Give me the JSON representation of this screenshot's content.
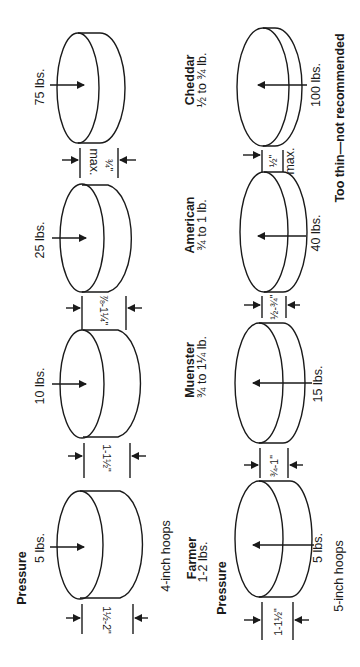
{
  "figure": {
    "orientation": "rotated 90 degrees counter-clockwise",
    "line_color": "#1a1a1a",
    "background": "#ffffff"
  },
  "top_row": {
    "hoop_label": "4-inch hoops",
    "pressure_label": "Pressure",
    "cylinders": [
      {
        "weight": "5 lbs.",
        "thickness": "1½-2\""
      },
      {
        "weight": "10 lbs.",
        "thickness": "1-1½\""
      },
      {
        "weight": "25 lbs.",
        "thickness": "⅞-1¼\""
      },
      {
        "weight": "75 lbs.",
        "thickness": "¾\" max."
      }
    ],
    "group_label": {
      "name": "Farmer",
      "size": "1-2 lbs."
    }
  },
  "bottom_row": {
    "hoop_label": "5-inch hoops",
    "pressure_label": "Pressure",
    "cylinders": [
      {
        "weight": "5 lbs.",
        "thickness": "1-1½\"",
        "cheese": "Farmer",
        "cheese_size": "1-2 lbs."
      },
      {
        "weight": "15 lbs.",
        "thickness": "¾-1\"",
        "cheese": "Muenster",
        "cheese_size": "¾ to 1¼ lb."
      },
      {
        "weight": "40 lbs.",
        "thickness": "½-¾\"",
        "cheese": "American",
        "cheese_size": "¾ to 1 lb."
      },
      {
        "weight": "100 lbs.",
        "thickness": "½\" max.",
        "cheese": "Cheddar",
        "cheese_size": "½ to ¾ lb."
      }
    ],
    "footnote": "Too thin—not recommended"
  },
  "labels": {
    "t_pressure": "Pressure",
    "t_w0": "5 lbs.",
    "t_w1": "10 lbs.",
    "t_w2": "25 lbs.",
    "t_w3": "75 lbs.",
    "t_d0": "1½-2\"",
    "t_d1": "1-1½\"",
    "t_d2": "⅞-1¼\"",
    "t_d3a": "¾\"",
    "t_d3b": "max.",
    "t_hoops": "4-inch hoops",
    "farmer": "Farmer",
    "farmer_size": "1-2 lbs.",
    "b_pressure": "Pressure",
    "muenster": "Muenster",
    "muenster_size": "¾ to 1¼ lb.",
    "american": "American",
    "american_size": "¾ to 1 lb.",
    "cheddar": "Cheddar",
    "cheddar_size": "½ to ¾ lb.",
    "b_w0": "5 lbs.",
    "b_w1": "15 lbs.",
    "b_w2": "40 lbs.",
    "b_w3": "100 lbs.",
    "b_d0": "1-1½\"",
    "b_d1": "¾-1\"",
    "b_d2": "½-¾\"",
    "b_d3a": "½\"",
    "b_d3b": "max.",
    "b_hoops": "5-inch hoops",
    "too_thin": "Too thin—not recommended"
  }
}
